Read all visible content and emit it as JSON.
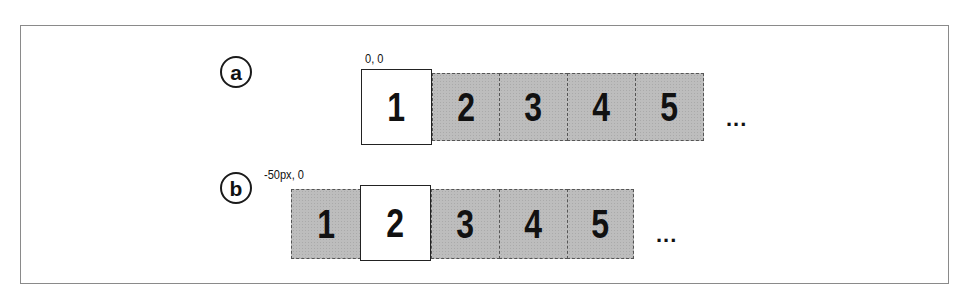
{
  "figure": {
    "rows": [
      {
        "id": "a",
        "label": "a",
        "coordinate": "0, 0",
        "cells": [
          {
            "value": "1",
            "state": "visible"
          },
          {
            "value": "2",
            "state": "offscreen"
          },
          {
            "value": "3",
            "state": "offscreen"
          },
          {
            "value": "4",
            "state": "offscreen"
          },
          {
            "value": "5",
            "state": "offscreen"
          }
        ],
        "continuation": "..."
      },
      {
        "id": "b",
        "label": "b",
        "coordinate": "-50px, 0",
        "cells": [
          {
            "value": "1",
            "state": "offscreen"
          },
          {
            "value": "2",
            "state": "visible"
          },
          {
            "value": "3",
            "state": "offscreen"
          },
          {
            "value": "4",
            "state": "offscreen"
          },
          {
            "value": "5",
            "state": "offscreen"
          }
        ],
        "continuation": "..."
      }
    ],
    "colors": {
      "visible_cell": "#ffffff",
      "offscreen_cell": "#bdbdbd",
      "border": "#8a8a8a",
      "text": "#111111"
    }
  }
}
